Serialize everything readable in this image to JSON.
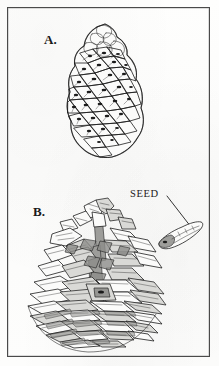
{
  "plate": {
    "title": "Pine cone plate",
    "background_color": "#fdfdfc",
    "frame_color": "#4a4a4a",
    "ink_color": "#1d1d1d",
    "width": 219,
    "height": 366
  },
  "figures": [
    {
      "id": "a",
      "label": "A.",
      "subject": "closed pine cone",
      "description": "unopened mature cone with tight diamond-shaped apophyses in spiral rows"
    },
    {
      "id": "b",
      "label": "B.",
      "subject": "open pine cone",
      "description": "opened cone with reflexed spreading scales and broad layered base"
    }
  ],
  "annotations": [
    {
      "id": "seed",
      "label": "SEED",
      "subject": "winged pine seed",
      "leader_from": [
        167,
        196
      ],
      "leader_to": [
        191,
        227
      ]
    }
  ]
}
